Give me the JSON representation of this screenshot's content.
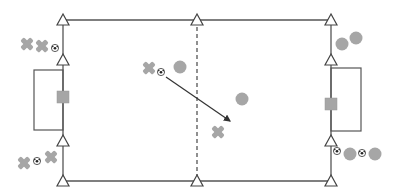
{
  "diagram": {
    "title": "",
    "type": "soccer-drill",
    "size": {
      "width": 398,
      "height": 195
    },
    "colors": {
      "line": "#555555",
      "cone_fill": "#ffffff",
      "cone_stroke": "#444444",
      "player_circle": "#a6a6a6",
      "player_cross": "#a6a6a6",
      "goal_marker": "#a6a6a6",
      "pass_arrow": "#333333"
    },
    "pitch": {
      "left": 63,
      "right": 331,
      "top": 20,
      "bottom": 181,
      "halfway_x": 197,
      "halfway_style": "dashed"
    },
    "goals": [
      {
        "side": "left",
        "x": 34,
        "y": 70,
        "w": 29,
        "h": 60,
        "marker": {
          "x": 63,
          "y": 97
        }
      },
      {
        "side": "right",
        "x": 331,
        "y": 68,
        "w": 30,
        "h": 63,
        "marker": {
          "x": 331,
          "y": 104
        }
      }
    ],
    "cones": [
      {
        "x": 63,
        "y": 20
      },
      {
        "x": 63,
        "y": 60
      },
      {
        "x": 63,
        "y": 141
      },
      {
        "x": 63,
        "y": 181
      },
      {
        "x": 197,
        "y": 20
      },
      {
        "x": 197,
        "y": 181
      },
      {
        "x": 331,
        "y": 20
      },
      {
        "x": 331,
        "y": 60
      },
      {
        "x": 331,
        "y": 141
      },
      {
        "x": 331,
        "y": 181
      }
    ],
    "cross_players": [
      {
        "x": 27,
        "y": 44
      },
      {
        "x": 42,
        "y": 46
      },
      {
        "x": 149,
        "y": 68
      },
      {
        "x": 218,
        "y": 132
      },
      {
        "x": 24,
        "y": 163
      },
      {
        "x": 51,
        "y": 157
      }
    ],
    "circle_players": [
      {
        "x": 180,
        "y": 67
      },
      {
        "x": 242,
        "y": 99
      },
      {
        "x": 342,
        "y": 44
      },
      {
        "x": 356,
        "y": 38
      },
      {
        "x": 350,
        "y": 154
      },
      {
        "x": 375,
        "y": 154
      }
    ],
    "balls": [
      {
        "x": 55,
        "y": 48
      },
      {
        "x": 161,
        "y": 72
      },
      {
        "x": 37,
        "y": 161
      },
      {
        "x": 337,
        "y": 151
      },
      {
        "x": 362,
        "y": 153
      }
    ],
    "pass_arrows": [
      {
        "x1": 166,
        "y1": 77,
        "x2": 230,
        "y2": 121
      }
    ]
  }
}
